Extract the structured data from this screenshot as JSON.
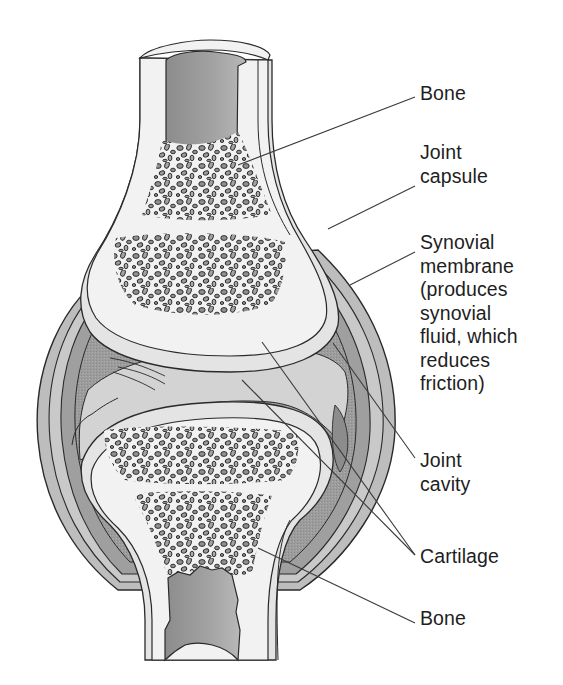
{
  "diagram": {
    "colors": {
      "background": "#ffffff",
      "bone_compact": "#f2f2f2",
      "marrow_cavity": "#9a9a9a",
      "spongy_pores": "#8f8f8f",
      "capsule": "#bdbdbd",
      "capsule_dark": "#8a8a8a",
      "synovial_membrane": "#a8a8a8",
      "cavity_fluid": "#d3d3d3",
      "cartilage": "#e4e4e4",
      "outline": "#2a2a2a",
      "leader_line": "#3a3a3a",
      "label_text": "#1e1e1e"
    },
    "labels": [
      {
        "id": "bone-top",
        "text": "Bone",
        "x": 420,
        "y": 84
      },
      {
        "id": "joint-capsule",
        "text": "Joint\ncapsule",
        "x": 420,
        "y": 145
      },
      {
        "id": "synovial-membrane",
        "text": "Synovial\nmembrane\n(produces\nsynovial\nfluid, which\nreduces\nfriction)",
        "x": 420,
        "y": 233
      },
      {
        "id": "joint-cavity",
        "text": "Joint\ncavity",
        "x": 420,
        "y": 450
      },
      {
        "id": "cartilage",
        "text": "Cartilage",
        "x": 420,
        "y": 548
      },
      {
        "id": "bone-bottom",
        "text": "Bone",
        "x": 420,
        "y": 607
      }
    ],
    "leader_lines": [
      {
        "label": "bone-top",
        "from": [
          415,
          97
        ],
        "to": [
          238,
          165
        ]
      },
      {
        "label": "joint-capsule",
        "from": [
          415,
          186
        ],
        "to": [
          328,
          229
        ]
      },
      {
        "label": "synovial-membrane",
        "from": [
          415,
          252
        ],
        "to": [
          350,
          285
        ]
      },
      {
        "label": "joint-cavity",
        "from": [
          415,
          458
        ],
        "to": [
          333,
          343
        ]
      },
      {
        "label": "cartilage",
        "from": [
          415,
          555
        ],
        "to": [
          262,
          342
        ]
      },
      {
        "label": "cartilage",
        "from": [
          415,
          555
        ],
        "to": [
          242,
          380
        ]
      },
      {
        "label": "bone-bottom",
        "from": [
          415,
          623
        ],
        "to": [
          258,
          548
        ]
      }
    ]
  }
}
